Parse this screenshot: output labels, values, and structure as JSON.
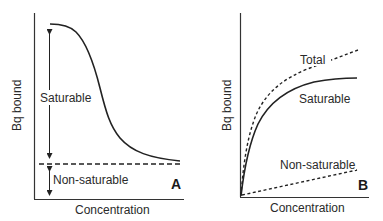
{
  "panels": [
    {
      "id": "A",
      "letter": "A",
      "xlabel": "Concentration",
      "ylabel": "Bq bound",
      "annotations": {
        "saturable": "Saturable",
        "non_saturable": "Non-saturable"
      },
      "description": "Displacement curve: bound radioactivity decreases sigmoidally with increasing concentration of unlabeled ligand, leveling to a non-saturable baseline (dashed line)."
    },
    {
      "id": "B",
      "letter": "B",
      "xlabel": "Concentration",
      "ylabel": "Bq bound",
      "annotations": {
        "total": "Total",
        "saturable": "Saturable",
        "non_saturable": "Non-saturable"
      },
      "description": "Saturation curves: total binding (dashed) = saturable (solid, hyperbolic) + non-saturable (dashed, linear)."
    }
  ],
  "colors": {
    "line": "#222222",
    "text": "#2a2a2a",
    "background": "#ffffff"
  }
}
